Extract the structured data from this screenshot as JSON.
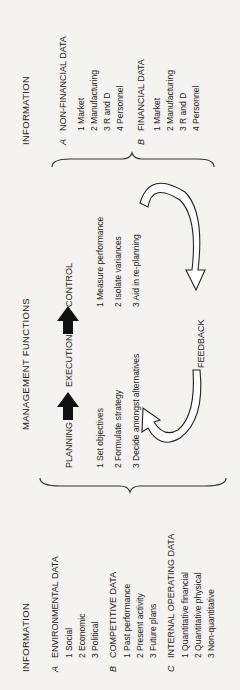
{
  "left_info": {
    "title": "INFORMATION",
    "groups": [
      {
        "letter": "A",
        "title": "ENVIRONMENTAL DATA",
        "items": [
          "1  Social",
          "2  Economic",
          "3  Political"
        ]
      },
      {
        "letter": "B",
        "title": "COMPETITIVE DATA",
        "items": [
          "1  Past performance",
          "2  Present activity",
          "3  Future plans"
        ]
      },
      {
        "letter": "C",
        "title": "INTERNAL OPERATING DATA",
        "items": [
          "1  Quantitative financial",
          "2  Quantitative physical",
          "3  Non-quantitative"
        ]
      }
    ]
  },
  "management": {
    "title": "MANAGEMENT FUNCTIONS",
    "stages": [
      "PLANNING",
      "EXECUTION",
      "CONTROL"
    ],
    "planning_items": [
      "1  Set objectives",
      "2  Formulate strategy",
      "3  Decide amongst alternatives"
    ],
    "control_items": [
      "1  Measure performance",
      "2  Isolate variances",
      "3  Aid in re-planning"
    ],
    "feedback_label": "FEEDBACK"
  },
  "right_info": {
    "title": "INFORMATION",
    "groups": [
      {
        "letter": "A",
        "title": "NON-FINANCIAL DATA",
        "items": [
          "1  Market",
          "2  Manufacturing",
          "3  R and D",
          "4  Personnel"
        ]
      },
      {
        "letter": "B",
        "title": "FINANCIAL DATA",
        "items": [
          "1  Market",
          "2  Manufacturing",
          "3  R and D",
          "4  Personnel"
        ]
      }
    ]
  }
}
